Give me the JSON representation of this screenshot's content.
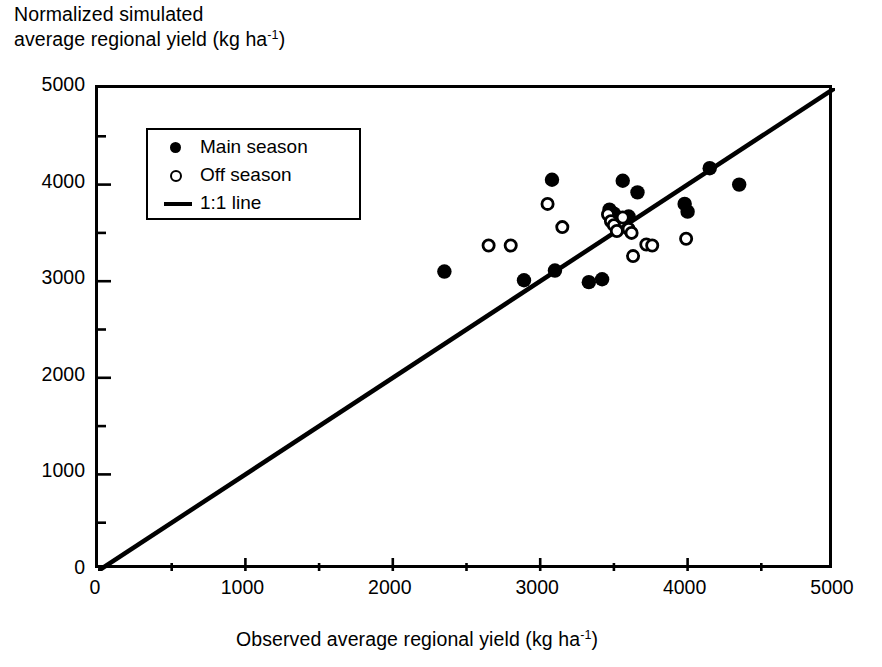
{
  "chart_data": {
    "type": "scatter",
    "title": "",
    "ylabel": "Normalized simulated average regional yield (kg ha-1)",
    "ylabel_line1": "Normalized simulated",
    "ylabel_line2_pre": "average regional yield (kg ha",
    "ylabel_sup": "-1",
    "ylabel_line2_post": ")",
    "xlabel": "Observed average regional yield (kg ha-1)",
    "xlabel_pre": "Observed average regional yield (kg ha",
    "xlabel_sup": "-1",
    "xlabel_post": ")",
    "xlim": [
      0,
      5000
    ],
    "ylim": [
      0,
      5000
    ],
    "xticks": [
      0,
      1000,
      2000,
      3000,
      4000,
      5000
    ],
    "yticks": [
      0,
      1000,
      2000,
      3000,
      4000,
      5000
    ],
    "xtick_labels": [
      "0",
      "1000",
      "2000",
      "3000",
      "4000",
      "5000"
    ],
    "ytick_labels": [
      "0",
      "1000",
      "2000",
      "3000",
      "4000",
      "5000"
    ],
    "minor_tick_interval": 500,
    "grid": false,
    "legend_position": "upper-left-inside",
    "marker_color": "#000000",
    "line_color": "#000000",
    "series": [
      {
        "name": "Main season",
        "marker": "filled-circle",
        "points": [
          [
            2350,
            3100
          ],
          [
            2890,
            3010
          ],
          [
            3080,
            4050
          ],
          [
            3100,
            3110
          ],
          [
            3330,
            2990
          ],
          [
            3420,
            3020
          ],
          [
            3470,
            3740
          ],
          [
            3500,
            3700
          ],
          [
            3560,
            4040
          ],
          [
            3600,
            3670
          ],
          [
            3660,
            3920
          ],
          [
            3980,
            3800
          ],
          [
            4000,
            3720
          ],
          [
            4150,
            4170
          ],
          [
            4350,
            4000
          ]
        ]
      },
      {
        "name": "Off season",
        "marker": "open-circle",
        "points": [
          [
            2650,
            3370
          ],
          [
            2800,
            3370
          ],
          [
            3050,
            3800
          ],
          [
            3150,
            3560
          ],
          [
            3460,
            3690
          ],
          [
            3480,
            3620
          ],
          [
            3500,
            3580
          ],
          [
            3520,
            3520
          ],
          [
            3560,
            3660
          ],
          [
            3600,
            3540
          ],
          [
            3620,
            3500
          ],
          [
            3630,
            3260
          ],
          [
            3720,
            3380
          ],
          [
            3760,
            3370
          ],
          [
            3990,
            3440
          ]
        ]
      },
      {
        "name": "1:1 line",
        "marker": "line",
        "points": [
          [
            0,
            0
          ],
          [
            5000,
            5000
          ]
        ]
      }
    ],
    "legend": [
      {
        "label": "Main season",
        "marker": "filled-circle"
      },
      {
        "label": "Off season",
        "marker": "open-circle"
      },
      {
        "label": "1:1 line",
        "marker": "line"
      }
    ]
  }
}
